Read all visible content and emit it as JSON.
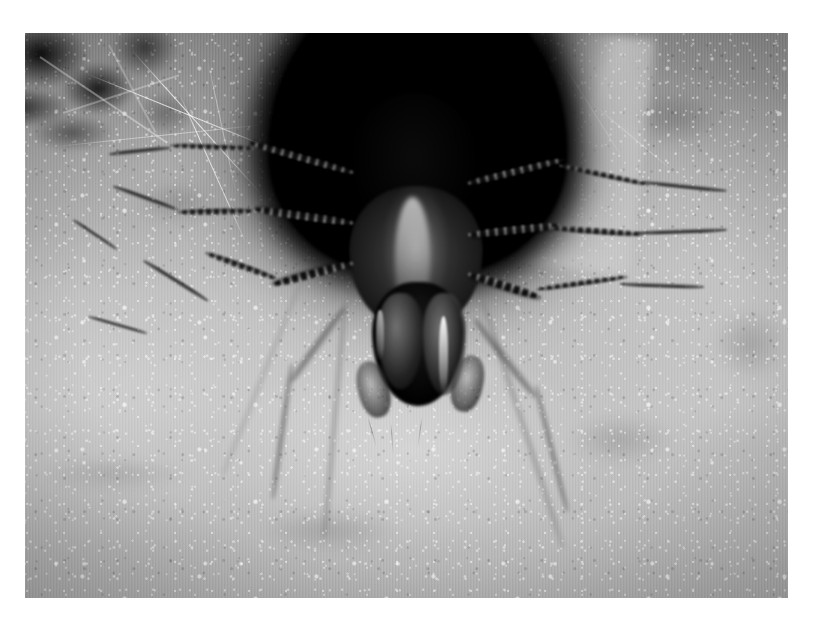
{
  "image": {
    "domain": "Natural-Image",
    "title": "Funnel-web spider at burrow entrance",
    "medium": "black-and-white macro photograph",
    "border": {
      "color": "#ffffff",
      "left_px": 25,
      "top_px": 33,
      "right_px": 29,
      "bottom_px": 29
    },
    "canvas": {
      "width": 817,
      "height": 627
    },
    "photo": {
      "x": 25,
      "y": 33,
      "width": 763,
      "height": 565
    },
    "palette": {
      "burrow_black": "#040404",
      "body_dark": "#141414",
      "leg_dark": "#1e1e1e",
      "web_midtone": "#b0b0b0",
      "web_highlight": "#e6e6e6",
      "web_shadow": "#7d7d7d",
      "frame_white": "#ffffff"
    }
  },
  "subject": {
    "name": "spider",
    "common_name": "funnel-web / grass spider",
    "pose": "facing forward at the mouth of its silk retreat",
    "parts": [
      {
        "name": "abdomen",
        "description": "dark mass merging into the burrow shadow"
      },
      {
        "name": "cephalothorax",
        "description": "mottled carapace with pale median stripe"
      },
      {
        "name": "chelicerae",
        "description": "dark jaws with a pale vertical glint"
      },
      {
        "name": "pedipalps",
        "description": "short dark appendages beside the jaws"
      },
      {
        "name": "legs",
        "count": 8,
        "description": "banded, spiny, splayed outward across the sheet web"
      }
    ]
  },
  "scene": {
    "background": "dense white sheet-web silk over ground",
    "elements": [
      {
        "name": "burrow-opening",
        "description": "black funnel mouth at top center"
      },
      {
        "name": "sheet-web",
        "description": "granular, luminous silk mat filling the frame"
      },
      {
        "name": "vegetation-debris",
        "description": "dark grass and litter in the upper-left corner"
      },
      {
        "name": "silk-strands",
        "description": "fine bright threads crossing the upper left"
      }
    ]
  },
  "legs": [
    {
      "id": "L1",
      "side": "left",
      "label": "front-left-leg",
      "tip": "upper-left",
      "length_rel": 0.3
    },
    {
      "id": "L2",
      "side": "left",
      "label": "second-left-leg",
      "tip": "mid-left",
      "length_rel": 0.34
    },
    {
      "id": "L3",
      "side": "left",
      "label": "third-left-leg",
      "tip": "lower-left",
      "length_rel": 0.38
    },
    {
      "id": "L4",
      "side": "left",
      "label": "rear-left-leg",
      "tip": "bottom-left",
      "length_rel": 0.46
    },
    {
      "id": "R1",
      "side": "right",
      "label": "front-right-leg",
      "tip": "upper-right",
      "length_rel": 0.32
    },
    {
      "id": "R2",
      "side": "right",
      "label": "second-right-leg",
      "tip": "mid-right",
      "length_rel": 0.36
    },
    {
      "id": "R3",
      "side": "right",
      "label": "third-right-leg",
      "tip": "lower-right",
      "length_rel": 0.4
    },
    {
      "id": "R4",
      "side": "right",
      "label": "rear-right-leg",
      "tip": "bottom-right",
      "length_rel": 0.44
    }
  ]
}
